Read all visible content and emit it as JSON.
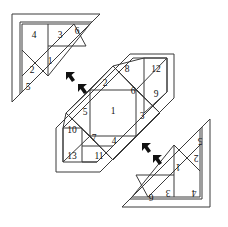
{
  "diagram": {
    "background_color": "#ffffff",
    "stroke_color": "#3a3a3a",
    "label_color": "#111111",
    "shapes": [
      {
        "id": "top-left-triangle",
        "name": "Top-left right triangle",
        "piece_count": 6,
        "pieces": [
          {
            "id": 1,
            "label": "1",
            "x": 50,
            "y": 62
          },
          {
            "id": 2,
            "label": "2",
            "x": 32,
            "y": 71
          },
          {
            "id": 3,
            "label": "3",
            "x": 60,
            "y": 36
          },
          {
            "id": 4,
            "label": "4",
            "x": 34,
            "y": 36
          },
          {
            "id": 5,
            "label": "5",
            "x": 28,
            "y": 88
          },
          {
            "id": 6,
            "label": "6",
            "x": 77,
            "y": 32
          }
        ]
      },
      {
        "id": "middle-diamond",
        "name": "Middle rotated square (diamond)",
        "piece_count": 13,
        "pieces": [
          {
            "id": 1,
            "label": "1",
            "x": 113,
            "y": 110
          },
          {
            "id": 2,
            "label": "2",
            "x": 105,
            "y": 86
          },
          {
            "id": 3,
            "label": "3",
            "x": 141,
            "y": 113
          },
          {
            "id": 4,
            "label": "4",
            "x": 114,
            "y": 139
          },
          {
            "id": 5,
            "label": "5",
            "x": 87,
            "y": 111
          },
          {
            "id": 6,
            "label": "6",
            "x": 134,
            "y": 88
          },
          {
            "id": 7,
            "label": "7",
            "x": 92,
            "y": 136
          },
          {
            "id": 8,
            "label": "8",
            "x": 127,
            "y": 63
          },
          {
            "id": 9,
            "label": "9",
            "x": 155,
            "y": 91
          },
          {
            "id": 10,
            "label": "10",
            "x": 73,
            "y": 128
          },
          {
            "id": 11,
            "label": "11",
            "x": 100,
            "y": 156
          },
          {
            "id": 12,
            "label": "12",
            "x": 155,
            "y": 63
          },
          {
            "id": 13,
            "label": "13",
            "x": 72,
            "y": 155
          }
        ]
      },
      {
        "id": "bottom-right-triangle",
        "name": "Bottom-right right triangle (rotated 180 degrees)",
        "piece_count": 6,
        "rotation_degrees": 180,
        "pieces": [
          {
            "id": 1,
            "label": "1",
            "x": 178,
            "y": 165
          },
          {
            "id": 2,
            "label": "2",
            "x": 196,
            "y": 156
          },
          {
            "id": 3,
            "label": "3",
            "x": 168,
            "y": 191
          },
          {
            "id": 4,
            "label": "4",
            "x": 194,
            "y": 191
          },
          {
            "id": 5,
            "label": "5",
            "x": 200,
            "y": 139
          },
          {
            "id": 6,
            "label": "6",
            "x": 151,
            "y": 195
          }
        ]
      }
    ],
    "arrow_markers": [
      {
        "id": "arrow-1",
        "x": 66,
        "y": 72,
        "direction": "up-left"
      },
      {
        "id": "arrow-2",
        "x": 78,
        "y": 84,
        "direction": "up-left"
      },
      {
        "id": "arrow-3",
        "x": 142,
        "y": 143,
        "direction": "up-left"
      },
      {
        "id": "arrow-4",
        "x": 153,
        "y": 155,
        "direction": "up-left"
      }
    ]
  }
}
